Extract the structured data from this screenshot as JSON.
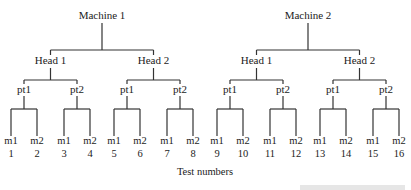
{
  "diagram": {
    "type": "nested-hierarchy-tree",
    "caption": "Test numbers",
    "machines": [
      {
        "label": "Machine 1",
        "heads": [
          {
            "label": "Head 1",
            "points": [
              {
                "label": "pt1",
                "measures": [
                  {
                    "label": "m1",
                    "test": "1"
                  },
                  {
                    "label": "m2",
                    "test": "2"
                  }
                ]
              },
              {
                "label": "pt2",
                "measures": [
                  {
                    "label": "m1",
                    "test": "3"
                  },
                  {
                    "label": "m2",
                    "test": "4"
                  }
                ]
              }
            ]
          },
          {
            "label": "Head 2",
            "points": [
              {
                "label": "pt1",
                "measures": [
                  {
                    "label": "m1",
                    "test": "5"
                  },
                  {
                    "label": "m2",
                    "test": "6"
                  }
                ]
              },
              {
                "label": "pt2",
                "measures": [
                  {
                    "label": "m1",
                    "test": "7"
                  },
                  {
                    "label": "m2",
                    "test": "8"
                  }
                ]
              }
            ]
          }
        ]
      },
      {
        "label": "Machine 2",
        "heads": [
          {
            "label": "Head 1",
            "points": [
              {
                "label": "pt1",
                "measures": [
                  {
                    "label": "m1",
                    "test": "9"
                  },
                  {
                    "label": "m2",
                    "test": "10"
                  }
                ]
              },
              {
                "label": "pt2",
                "measures": [
                  {
                    "label": "m1",
                    "test": "11"
                  },
                  {
                    "label": "m2",
                    "test": "12"
                  }
                ]
              }
            ]
          },
          {
            "label": "Head 2",
            "points": [
              {
                "label": "pt1",
                "measures": [
                  {
                    "label": "m1",
                    "test": "13"
                  },
                  {
                    "label": "m2",
                    "test": "14"
                  }
                ]
              },
              {
                "label": "pt2",
                "measures": [
                  {
                    "label": "m1",
                    "test": "15"
                  },
                  {
                    "label": "m2",
                    "test": "16"
                  }
                ]
              }
            ]
          }
        ]
      }
    ]
  },
  "colors": {
    "line": "#333333",
    "text": "#222222",
    "background": "#ffffff"
  }
}
